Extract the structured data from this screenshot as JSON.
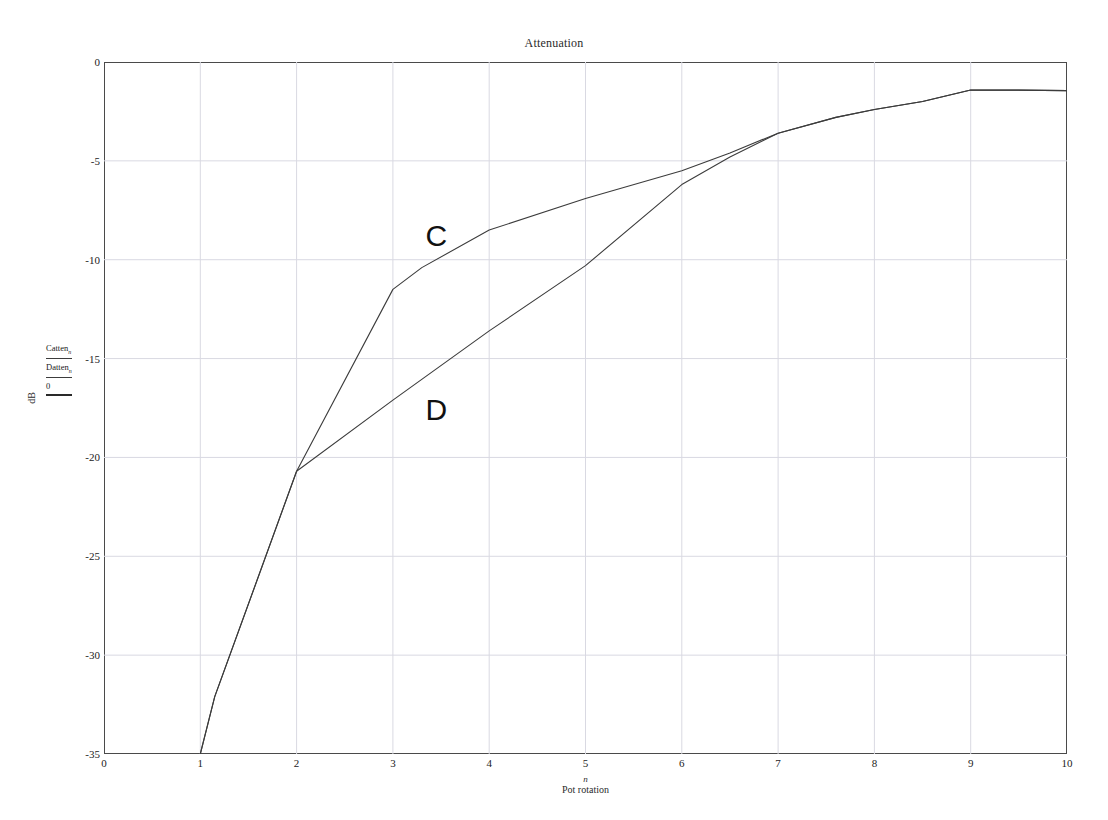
{
  "chart_data": {
    "type": "line",
    "title": "Attenuation",
    "xlabel": "Pot rotation",
    "xvar": "n",
    "ylabel": "dB",
    "xlim": [
      0,
      10
    ],
    "ylim": [
      -35,
      0
    ],
    "grid": true,
    "xticks": [
      0,
      1,
      2,
      3,
      4,
      5,
      6,
      7,
      8,
      9,
      10
    ],
    "xtick_labels": [
      "0",
      "1",
      "2",
      "3",
      "4",
      "5",
      "6",
      "7",
      "8",
      "9",
      "10"
    ],
    "yticks": [
      0,
      -5,
      -10,
      -15,
      -20,
      -25,
      -30,
      -35
    ],
    "ytick_labels": [
      "0",
      "-5",
      "-10",
      "-15",
      "-20",
      "-25",
      "-30",
      "-35"
    ],
    "legend_position": "left-outside",
    "series": [
      {
        "name": "Catten",
        "subscript": "n",
        "annotation": "C",
        "annotation_x": 3.45,
        "annotation_y": -8.8,
        "color": "#3c3c3c",
        "x": [
          1.0,
          1.15,
          2.0,
          3.0,
          3.3,
          4.0,
          5.0,
          6.0,
          6.5,
          7.0,
          7.6,
          8.0,
          8.5,
          9.0,
          9.5,
          10.0
        ],
        "y": [
          -35.0,
          -32.1,
          -20.7,
          -11.5,
          -10.4,
          -8.5,
          -6.9,
          -5.5,
          -4.6,
          -3.6,
          -2.8,
          -2.4,
          -2.0,
          -1.42,
          -1.42,
          -1.45
        ]
      },
      {
        "name": "Datten",
        "subscript": "n",
        "annotation": "D",
        "annotation_x": 3.45,
        "annotation_y": -17.6,
        "color": "#3c3c3c",
        "x": [
          1.0,
          1.15,
          2.0,
          3.0,
          4.0,
          5.0,
          6.0,
          6.5,
          7.0,
          7.6,
          8.0,
          8.5,
          9.0,
          9.5,
          10.0
        ],
        "y": [
          -35.0,
          -32.1,
          -20.7,
          -17.1,
          -13.6,
          -10.3,
          -6.2,
          -4.8,
          -3.6,
          -2.8,
          -2.4,
          -2.0,
          -1.42,
          -1.42,
          -1.45
        ]
      }
    ],
    "reference_entry": "0"
  },
  "legend": {
    "entries": [
      {
        "label": "Catten",
        "sub": "n"
      },
      {
        "label": "Datten",
        "sub": "n"
      },
      {
        "label": "0",
        "sub": ""
      }
    ]
  }
}
